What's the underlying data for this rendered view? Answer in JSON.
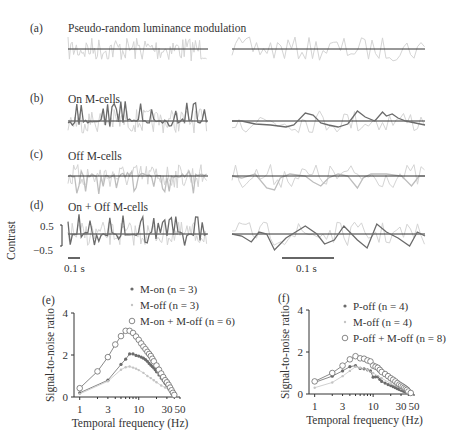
{
  "panels": {
    "a": {
      "letter": "(a)",
      "title": "Pseudo-random luminance modulation"
    },
    "b": {
      "letter": "(b)",
      "title": "On M-cells"
    },
    "c": {
      "letter": "(c)",
      "title": "Off M-cells"
    },
    "d": {
      "letter": "(d)",
      "title": "On + Off M-cells"
    },
    "e": {
      "letter": "(e)"
    },
    "f": {
      "letter": "(f)"
    }
  },
  "traces": {
    "ylabel": "Contrast",
    "yticks": [
      "0.5",
      "−0.5"
    ],
    "scalebar_left": "0.1 s",
    "scalebar_right": "0.1 s"
  },
  "colors": {
    "stimulus": "#d4d4d4",
    "response_dark": "#6b6b6b",
    "response_light": "#bdbdbd",
    "axis": "#333333",
    "baseline": "#333333"
  },
  "chart_data": [
    {
      "panel": "e",
      "type": "line",
      "xscale": "log",
      "xlabel": "Temporal frequency (Hz)",
      "ylabel": "Signal-to-noise ratio",
      "xticks": [
        "1",
        "3",
        "10",
        "30",
        "50"
      ],
      "yticks": [
        "0",
        "2",
        "4"
      ],
      "xlim": [
        0.8,
        50
      ],
      "ylim": [
        0,
        4
      ],
      "legend_position": "upper right",
      "series": [
        {
          "name": "M-on (n = 3)",
          "marker": "filled-dot",
          "color": "#6b6b6b",
          "x": [
            1,
            3,
            5,
            6,
            7,
            8,
            9,
            10,
            11,
            12,
            13,
            14,
            15,
            16,
            17,
            18,
            19,
            20,
            22,
            24,
            26,
            28,
            30,
            32,
            34,
            36,
            38,
            40
          ],
          "y": [
            0.2,
            0.8,
            1.55,
            1.8,
            2.05,
            2.05,
            1.98,
            1.95,
            1.9,
            1.85,
            1.78,
            1.7,
            1.6,
            1.52,
            1.45,
            1.38,
            1.3,
            1.2,
            1.05,
            0.9,
            0.78,
            0.65,
            0.55,
            0.45,
            0.35,
            0.25,
            0.15,
            0.1
          ]
        },
        {
          "name": "M-off (n = 3)",
          "marker": "small-dot",
          "color": "#c4c4c4",
          "x": [
            1,
            3,
            5,
            6,
            7,
            8,
            9,
            10,
            12,
            14,
            16,
            18,
            20,
            24,
            28,
            32,
            36,
            40
          ],
          "y": [
            0.15,
            0.75,
            1.3,
            1.42,
            1.45,
            1.4,
            1.35,
            1.28,
            1.15,
            1.0,
            0.9,
            0.8,
            0.7,
            0.55,
            0.45,
            0.35,
            0.22,
            0.1
          ]
        },
        {
          "name": "M-on + M-off (n = 6)",
          "marker": "open-circle",
          "color": "#6b6b6b",
          "x": [
            1,
            2,
            3,
            4,
            5,
            6,
            7,
            8,
            9,
            10,
            11,
            12,
            13,
            14,
            15,
            16,
            17,
            18,
            20,
            22,
            24,
            26,
            28,
            30,
            32,
            34,
            36,
            38,
            40
          ],
          "y": [
            0.42,
            1.22,
            1.9,
            2.5,
            2.9,
            3.15,
            3.15,
            3.05,
            2.88,
            2.72,
            2.55,
            2.4,
            2.28,
            2.15,
            2.05,
            1.95,
            1.82,
            1.7,
            1.5,
            1.3,
            1.12,
            0.95,
            0.8,
            0.7,
            0.58,
            0.45,
            0.32,
            0.2,
            0.1
          ]
        }
      ]
    },
    {
      "panel": "f",
      "type": "line",
      "xscale": "log",
      "xlabel": "Temporal frequency (Hz)",
      "ylabel": "Signal-to-noise ratio",
      "xticks": [
        "1",
        "3",
        "10",
        "30",
        "50"
      ],
      "yticks": [
        "0",
        "2",
        "4"
      ],
      "xlim": [
        0.8,
        50
      ],
      "ylim": [
        0,
        4
      ],
      "legend_position": "upper right",
      "series": [
        {
          "name": "P-off (n = 4)",
          "marker": "filled-dot",
          "color": "#6b6b6b",
          "x": [
            1,
            2,
            3,
            4,
            5,
            6,
            7,
            8,
            9,
            10,
            11,
            12,
            13,
            14,
            16,
            18,
            20,
            22,
            24,
            26,
            28,
            30,
            32,
            34,
            36,
            38,
            40
          ],
          "y": [
            0.55,
            0.85,
            1.1,
            1.3,
            1.35,
            1.22,
            1.2,
            1.15,
            1.1,
            0.8,
            0.82,
            0.82,
            0.7,
            0.6,
            0.52,
            0.45,
            0.4,
            0.35,
            0.3,
            0.25,
            0.22,
            0.18,
            0.15,
            0.12,
            0.1,
            0.08,
            0.05
          ]
        },
        {
          "name": "M-off (n = 4)",
          "marker": "small-dot",
          "color": "#c4c4c4",
          "x": [
            1,
            2,
            3,
            4,
            5,
            6,
            8,
            10,
            14,
            20,
            30,
            40
          ],
          "y": [
            0.3,
            0.55,
            0.85,
            1.1,
            1.3,
            1.25,
            1.15,
            1.0,
            0.75,
            0.5,
            0.25,
            0.05
          ]
        },
        {
          "name": "P-off + M-off (n = 8)",
          "marker": "open-circle",
          "color": "#6b6b6b",
          "x": [
            1,
            2,
            3,
            4,
            5,
            6,
            7,
            8,
            9,
            10,
            11,
            12,
            13,
            14,
            16,
            18,
            20,
            22,
            24,
            26,
            28,
            30,
            32,
            34,
            36,
            38,
            40,
            44
          ],
          "y": [
            0.6,
            1.0,
            1.35,
            1.65,
            1.8,
            1.7,
            1.68,
            1.6,
            1.55,
            1.35,
            1.3,
            1.25,
            1.15,
            1.05,
            0.95,
            0.85,
            0.75,
            0.68,
            0.6,
            0.52,
            0.45,
            0.4,
            0.35,
            0.3,
            0.25,
            0.2,
            0.12,
            0.05
          ]
        }
      ]
    }
  ]
}
